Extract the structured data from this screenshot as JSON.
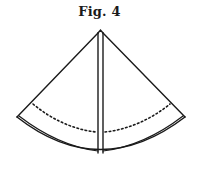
{
  "figure": {
    "title": "Fig. 4",
    "colors": {
      "stroke": "#1a1a1a",
      "background": "#ffffff"
    },
    "elements": {
      "outline": "sector-outline",
      "center_fold": "double-vertical-line",
      "bottom_edge": "double-arc",
      "dotted_line": "dotted-arc"
    }
  }
}
